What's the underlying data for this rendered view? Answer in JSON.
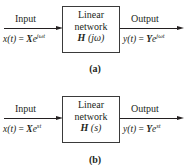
{
  "panels": [
    {
      "id": "a",
      "input_label": "Input",
      "output_label": "Output",
      "input_eq": {
        "lhs": "x(t)",
        "eq": "=",
        "coef": "X",
        "base": "e",
        "exp": "jωt"
      },
      "output_eq": {
        "lhs": "y(t)",
        "eq": "=",
        "coef": "Y",
        "base": "e",
        "exp": "jωt"
      },
      "box": {
        "line1": "Linear",
        "line2": "network",
        "func_name": "H",
        "func_arg": "(jω)"
      },
      "caption": "(a)"
    },
    {
      "id": "b",
      "input_label": "Input",
      "output_label": "Output",
      "input_eq": {
        "lhs": "x(t)",
        "eq": "=",
        "coef": "X",
        "base": "e",
        "exp": "st"
      },
      "output_eq": {
        "lhs": "y(t)",
        "eq": "=",
        "coef": "Y",
        "base": "e",
        "exp": "st"
      },
      "box": {
        "line1": "Linear",
        "line2": "network",
        "func_name": "H",
        "func_arg": "(s)"
      },
      "caption": "(b)"
    }
  ],
  "colors": {
    "line": "#231f20",
    "box_border": "#3a3a3a",
    "background": "#ffffff"
  }
}
